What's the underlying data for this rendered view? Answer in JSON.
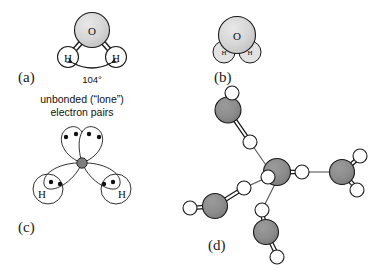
{
  "figure": {
    "width": 381,
    "height": 270,
    "background": "#ffffff"
  },
  "colors": {
    "oxygen_fill_light": "#d4d4d4",
    "oxygen_fill_dark": "#8a8a8a",
    "oxygen_fill_nucleus": "#9a9a9a",
    "hydrogen_fill": "#ffffff",
    "outline": "#1a1a1a",
    "text": "#111111",
    "bond_line": "#1a1a1a",
    "hbond_line": "#555555"
  },
  "panels": [
    {
      "id": "a",
      "label": "(a)",
      "atoms": [
        {
          "name": "oxygen",
          "symbol": "O"
        },
        {
          "name": "hydrogen-left",
          "symbol": "H"
        },
        {
          "name": "hydrogen-right",
          "symbol": "H"
        }
      ],
      "annotation": {
        "name": "bond-angle",
        "value": "104",
        "unit": "°",
        "text": "104°"
      }
    },
    {
      "id": "b",
      "label": "(b)",
      "atoms": [
        {
          "name": "oxygen",
          "symbol": "O"
        },
        {
          "name": "hydrogen-left",
          "symbol": "H"
        },
        {
          "name": "hydrogen-right",
          "symbol": "H"
        }
      ]
    },
    {
      "id": "c",
      "label": "(c)",
      "caption_line1": "unbonded (“lone”)",
      "caption_line2": "electron pairs",
      "atoms": [
        {
          "name": "hydrogen-left",
          "symbol": "H"
        },
        {
          "name": "hydrogen-right",
          "symbol": "H"
        }
      ],
      "lobes": [
        {
          "name": "lone-pair-lobe-left",
          "electrons": 2
        },
        {
          "name": "lone-pair-lobe-right",
          "electrons": 2
        },
        {
          "name": "bonding-lobe-left",
          "electrons": 2
        },
        {
          "name": "bonding-lobe-right",
          "electrons": 2
        }
      ]
    },
    {
      "id": "d",
      "label": "(d)",
      "description": "tetrahedral hydrogen-bonded water network",
      "molecule_count": 5,
      "hydrogen_bond_count": 4
    }
  ]
}
